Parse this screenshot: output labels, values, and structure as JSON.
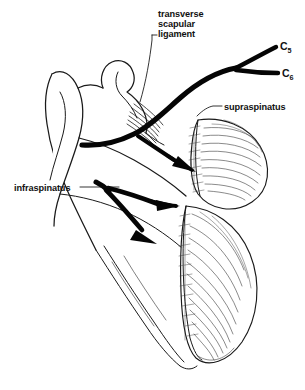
{
  "figure": {
    "background_color": "#ffffff",
    "ink_color": "#111111",
    "width": 305,
    "height": 390
  },
  "labels": {
    "transverse_scapular_ligament": {
      "line1": "transverse",
      "line2": "scapular",
      "line3": "ligament"
    },
    "supraspinatus": "supraspinatus",
    "infraspinatus": "infraspinatus",
    "c5": "C",
    "c5_sub": "5",
    "c6": "C",
    "c6_sub": "6"
  },
  "structures": {
    "nerve_name": "suprascapular-nerve",
    "nerve_color": "#050505",
    "roots": [
      "C5",
      "C6"
    ],
    "muscles": [
      "supraspinatus",
      "infraspinatus"
    ],
    "bone": "scapula"
  }
}
